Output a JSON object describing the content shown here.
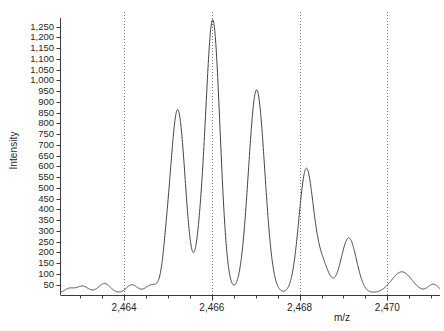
{
  "chart_data": {
    "type": "line",
    "title": "",
    "xlabel": "m/z",
    "ylabel": "Intensity",
    "xlim": [
      2462.55,
      2471.2
    ],
    "ylim": [
      0,
      1290
    ],
    "grid": "vertical-dotted-at-xticks",
    "legend": "none",
    "xticks": [
      2464,
      2466,
      2468,
      2470
    ],
    "xtick_labels": [
      "2,464",
      "2,466",
      "2,468",
      "2,470"
    ],
    "x_minor_tick_step": 0.5,
    "yticks": [
      50,
      100,
      150,
      200,
      250,
      300,
      350,
      400,
      450,
      500,
      550,
      600,
      650,
      700,
      750,
      800,
      850,
      900,
      950,
      1000,
      1050,
      1100,
      1150,
      1200,
      1250
    ],
    "ytick_labels": [
      "50",
      "100",
      "150",
      "200",
      "250",
      "300",
      "350",
      "400",
      "450",
      "500",
      "550",
      "600",
      "650",
      "700",
      "750",
      "800",
      "850",
      "900",
      "950",
      "1,000",
      "1,050",
      "1,100",
      "1,150",
      "1,200",
      "1,250"
    ],
    "series": [
      {
        "name": "mass spectrum",
        "color": "#444444",
        "peaks": [
          {
            "center": 2465.22,
            "height": 852,
            "width": 0.175,
            "label": "peak-1"
          },
          {
            "center": 2466.02,
            "height": 1268,
            "width": 0.165,
            "label": "peak-2-base"
          },
          {
            "center": 2467.02,
            "height": 944,
            "width": 0.185,
            "label": "peak-3"
          },
          {
            "center": 2468.15,
            "height": 572,
            "width": 0.165,
            "label": "peak-4"
          },
          {
            "center": 2469.12,
            "height": 256,
            "width": 0.175,
            "label": "peak-5"
          },
          {
            "center": 2470.33,
            "height": 98,
            "width": 0.235,
            "label": "peak-6"
          },
          {
            "center": 2465.72,
            "height": 118,
            "width": 0.105,
            "label": "shoulder-a"
          },
          {
            "center": 2468.52,
            "height": 126,
            "width": 0.155,
            "label": "shoulder-b"
          },
          {
            "center": 2463.05,
            "height": 32,
            "width": 0.135,
            "label": "noise-a"
          },
          {
            "center": 2463.55,
            "height": 44,
            "width": 0.135,
            "label": "noise-b"
          },
          {
            "center": 2464.18,
            "height": 38,
            "width": 0.125,
            "label": "noise-c"
          },
          {
            "center": 2464.62,
            "height": 36,
            "width": 0.135,
            "label": "noise-d"
          },
          {
            "center": 2464.95,
            "height": 52,
            "width": 0.075,
            "label": "noise-e"
          },
          {
            "center": 2462.75,
            "height": 20,
            "width": 0.105,
            "label": "noise-f"
          },
          {
            "center": 2471.05,
            "height": 40,
            "width": 0.125,
            "label": "noise-g"
          }
        ],
        "baseline": 12
      }
    ]
  },
  "axes": {
    "y_title": "Intensity",
    "x_title": "m/z"
  }
}
